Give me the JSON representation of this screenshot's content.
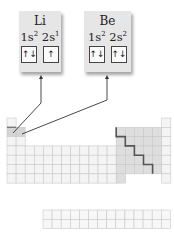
{
  "cards": [
    {
      "element": "Li",
      "orbitals": [
        {
          "label": "1s",
          "exp": "2",
          "arrows": "↑↓"
        },
        {
          "label": "2s",
          "exp": "1",
          "arrows": "↑"
        }
      ]
    },
    {
      "element": "Be",
      "orbitals": [
        {
          "label": "1s",
          "exp": "2",
          "arrows": "↑↓"
        },
        {
          "label": "2s",
          "exp": "2",
          "arrows": "↑↓"
        }
      ]
    }
  ],
  "periodic_table": {
    "columns": 18,
    "rows": 7,
    "f_block_rows": 2,
    "f_block_columns": 14,
    "highlighted_cells": [
      "Li",
      "Be"
    ]
  },
  "colors": {
    "card_bg": "#e6e6e6",
    "grid_line": "#c9c9c9",
    "cell_light": "#f4f4f4",
    "cell_shaded": "#dedede",
    "highlight": "#d4d4d4",
    "staircase": "#555555",
    "arrow": "#333333"
  }
}
